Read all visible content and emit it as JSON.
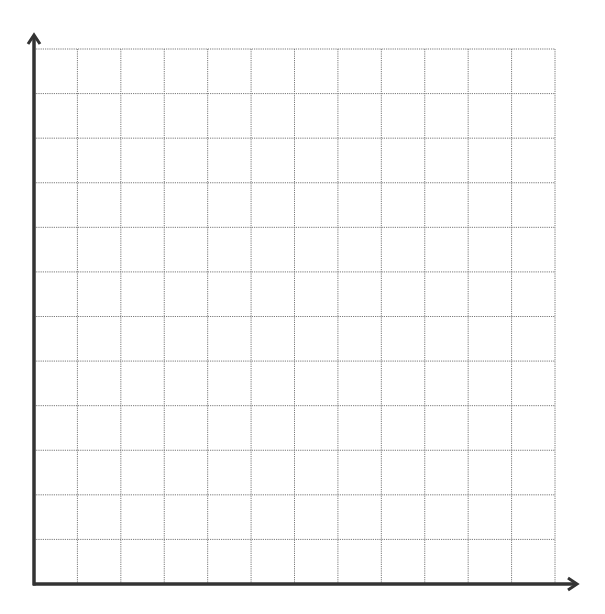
{
  "diagram": {
    "type": "blank-coordinate-grid",
    "quadrant": "first",
    "columns": 12,
    "rows": 12,
    "grid_style": "dotted",
    "colors": {
      "background": "#ffffff",
      "axis": "#333333",
      "grid": "#7a7a7a"
    },
    "geometry": {
      "origin": [
        34,
        584
      ],
      "grid_right": 555,
      "grid_top": 49,
      "x_axis_end": 577,
      "y_axis_end": 35
    },
    "axes": {
      "x": {
        "label": "",
        "arrow": true
      },
      "y": {
        "label": "",
        "arrow": true
      }
    }
  }
}
